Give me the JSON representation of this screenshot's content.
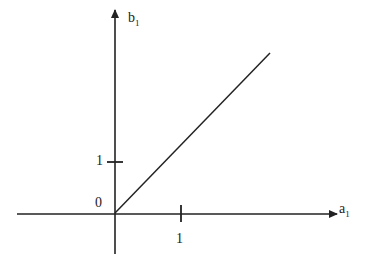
{
  "diagram": {
    "y_axis_label": "b",
    "y_axis_sub": "1",
    "x_axis_label": "a",
    "x_axis_sub": "1",
    "origin_label": "0",
    "y_tick_label": "1",
    "x_tick_label": "1",
    "line_color": "#222222",
    "line": {
      "from": [
        0,
        0
      ],
      "to": [
        4.7,
        4.7
      ],
      "description": "line through origin, slope 1"
    }
  }
}
